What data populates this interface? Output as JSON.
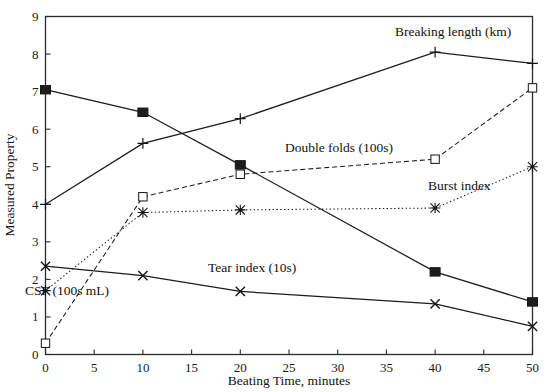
{
  "chart_data": {
    "type": "line",
    "title": "",
    "xlabel": "Beating Time, minutes",
    "ylabel": "Measured Property",
    "x": [
      0,
      10,
      20,
      40,
      50
    ],
    "xlim": [
      0,
      50
    ],
    "ylim": [
      0,
      9
    ],
    "xticks": [
      0,
      5,
      10,
      15,
      20,
      25,
      30,
      35,
      40,
      45,
      50
    ],
    "yticks": [
      0,
      1,
      2,
      3,
      4,
      5,
      6,
      7,
      8,
      9
    ],
    "xtick_labels": [
      "0",
      "5",
      "10",
      "15",
      "20",
      "25",
      "30",
      "35",
      "40",
      "45",
      "50"
    ],
    "ytick_labels": [
      "0",
      "1",
      "2",
      "3",
      "4",
      "5",
      "6",
      "7",
      "8",
      "9"
    ],
    "grid": false,
    "legend_position": "inline-annotations",
    "series": [
      {
        "name": "CSF (100s mL)",
        "label": "CSF (100s mL)",
        "marker": "filled-square",
        "linestyle": "solid",
        "color": "#1c1c1c",
        "values": [
          7.05,
          6.45,
          5.05,
          2.2,
          1.4
        ],
        "label_x": 25,
        "label_y": 295
      },
      {
        "name": "Breaking length (km)",
        "label": "Breaking length (km)",
        "marker": "plus",
        "linestyle": "solid",
        "color": "#1c1c1c",
        "values": [
          4.0,
          5.62,
          6.28,
          8.05,
          7.75
        ],
        "label_x": 395,
        "label_y": 36
      },
      {
        "name": "Double folds (100s)",
        "label": "Double folds (100s)",
        "marker": "open-square",
        "linestyle": "dashed",
        "color": "#1c1c1c",
        "values": [
          0.3,
          4.2,
          4.8,
          5.2,
          7.1
        ],
        "label_x": 285,
        "label_y": 152
      },
      {
        "name": "Burst index",
        "label": "Burst index",
        "marker": "asterisk",
        "linestyle": "dotted",
        "color": "#1c1c1c",
        "values": [
          1.7,
          3.78,
          3.85,
          3.9,
          5.0
        ],
        "label_x": 428,
        "label_y": 190
      },
      {
        "name": "Tear index (10s)",
        "label": "Tear index (10s)",
        "marker": "cross",
        "linestyle": "solid",
        "color": "#1c1c1c",
        "values": [
          2.35,
          2.1,
          1.68,
          1.35,
          0.75
        ],
        "label_x": 208,
        "label_y": 272
      }
    ]
  },
  "axes": {
    "x_title": "Beating Time, minutes",
    "y_title": "Measured Property"
  }
}
